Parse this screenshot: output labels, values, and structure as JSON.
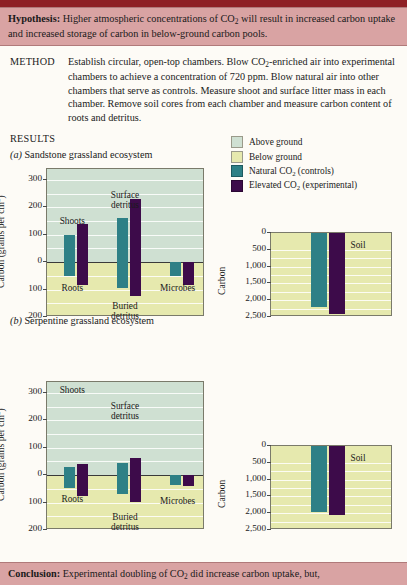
{
  "header": {
    "hypothesis_label": "Hypothesis:",
    "hypothesis_text_1": "Higher atmospheric concentrations of CO",
    "hypothesis_sub": "2",
    "hypothesis_text_2": " will result in increased carbon uptake and increased storage of carbon in below-ground carbon pools."
  },
  "method": {
    "label": "METHOD",
    "text_1": "Establish circular, open-top chambers. Blow CO",
    "sub_1": "2",
    "text_2": "-enriched air into experimental chambers to achieve a concentration of 720 ppm. Blow natural air into other chambers that serve as controls. Measure shoot and surface litter mass in each chamber. Remove soil cores from each chamber and measure carbon content of roots and detritus."
  },
  "results": {
    "label": "RESULTS"
  },
  "legend": {
    "items": [
      {
        "label": "Above ground",
        "color": "#cfe0d2"
      },
      {
        "label": "Below ground",
        "color": "#e6e9ae"
      },
      {
        "label": "Natural CO",
        "sub": "2",
        "suffix": " (controls)",
        "color": "#2e8086"
      },
      {
        "label": "Elevated CO",
        "sub": "2",
        "suffix": " (experimental)",
        "color": "#3d0b4a"
      }
    ]
  },
  "panels": [
    {
      "marker": "(a)",
      "title": "Sandstone grassland ecosystem",
      "main_chart": {
        "ylabel_1": "Carbon (grams per cm",
        "ylabel_sup": "2",
        "ylabel_2": ")",
        "ticks": [
          "300",
          "200",
          "100",
          "0",
          "100",
          "200"
        ],
        "group_labels_above": [
          "Shoots",
          "Surface detritus",
          ""
        ],
        "group_labels_below": [
          "Roots",
          "Buried detritus",
          "Microbes"
        ]
      },
      "soil_chart": {
        "ylabel": "Carbon",
        "ticks": [
          "0",
          "500",
          "1,000",
          "1,500",
          "2,000",
          "2,500"
        ],
        "area_label": "Soil"
      }
    },
    {
      "marker": "(b)",
      "title": "Serpentine grassland ecosystem",
      "main_chart": {
        "ylabel_1": "Carbon (grams per cm",
        "ylabel_sup": "2",
        "ylabel_2": ")",
        "ticks": [
          "300",
          "200",
          "100",
          "0",
          "100",
          "200"
        ],
        "group_labels_above": [
          "Shoots",
          "Surface detritus",
          ""
        ],
        "group_labels_below": [
          "Roots",
          "Buried detritus",
          "Microbes"
        ]
      },
      "soil_chart": {
        "ylabel": "Carbon",
        "ticks": [
          "0",
          "500",
          "1,000",
          "1,500",
          "2,000",
          "2,500"
        ],
        "area_label": "Soil"
      }
    }
  ],
  "conclusion": {
    "label": "Conclusion:",
    "text_1": " Experimental doubling of CO",
    "sub": "2",
    "text_2": " did increase carbon uptake, but,"
  },
  "chart_data": [
    {
      "type": "bar",
      "title": "(a) Sandstone grassland ecosystem",
      "ylabel": "Carbon (grams per cm2)",
      "ylim": [
        -200,
        340
      ],
      "yticks": [
        300,
        200,
        100,
        0,
        -100,
        -200
      ],
      "ytick_labels": [
        "300",
        "200",
        "100",
        "0",
        "100",
        "200"
      ],
      "grid": true,
      "categories": [
        "Shoots / Roots",
        "Surface detritus / Buried detritus",
        "Microbes"
      ],
      "series": [
        {
          "name": "Natural CO2 (controls)",
          "color": "#2e8086",
          "above": [
            100,
            160,
            0
          ],
          "below": [
            -50,
            -95,
            -50
          ]
        },
        {
          "name": "Elevated CO2 (experimental)",
          "color": "#3d0b4a",
          "above": [
            140,
            230,
            0
          ],
          "below": [
            -85,
            -125,
            -85
          ]
        }
      ]
    },
    {
      "type": "bar",
      "title": "(a) Soil",
      "ylabel": "Carbon",
      "ylim": [
        2500,
        0
      ],
      "yticks": [
        0,
        500,
        1000,
        1500,
        2000,
        2500
      ],
      "ytick_labels": [
        "0",
        "500",
        "1,000",
        "1,500",
        "2,000",
        "2,500"
      ],
      "inverted": true,
      "grid": true,
      "categories": [
        "Soil"
      ],
      "series": [
        {
          "name": "Natural CO2 (controls)",
          "color": "#2e8086",
          "values": [
            2200
          ]
        },
        {
          "name": "Elevated CO2 (experimental)",
          "color": "#3d0b4a",
          "values": [
            2400
          ]
        }
      ]
    },
    {
      "type": "bar",
      "title": "(b) Serpentine grassland ecosystem",
      "ylabel": "Carbon (grams per cm2)",
      "ylim": [
        -200,
        340
      ],
      "yticks": [
        300,
        200,
        100,
        0,
        -100,
        -200
      ],
      "ytick_labels": [
        "300",
        "200",
        "100",
        "0",
        "100",
        "200"
      ],
      "grid": true,
      "categories": [
        "Shoots / Roots",
        "Surface detritus / Buried detritus",
        "Microbes"
      ],
      "series": [
        {
          "name": "Natural CO2 (controls)",
          "color": "#2e8086",
          "above": [
            30,
            45,
            0
          ],
          "below": [
            -48,
            -68,
            -35
          ]
        },
        {
          "name": "Elevated CO2 (experimental)",
          "color": "#3d0b4a",
          "above": [
            40,
            62,
            0
          ],
          "below": [
            -75,
            -98,
            -38
          ]
        }
      ]
    },
    {
      "type": "bar",
      "title": "(b) Soil",
      "ylabel": "Carbon",
      "ylim": [
        2500,
        0
      ],
      "yticks": [
        0,
        500,
        1000,
        1500,
        2000,
        2500
      ],
      "ytick_labels": [
        "0",
        "500",
        "1,000",
        "1,500",
        "2,000",
        "2,500"
      ],
      "inverted": true,
      "grid": true,
      "categories": [
        "Soil"
      ],
      "series": [
        {
          "name": "Natural CO2 (controls)",
          "color": "#2e8086",
          "values": [
            1950
          ]
        },
        {
          "name": "Elevated CO2 (experimental)",
          "color": "#3d0b4a",
          "values": [
            2050
          ]
        }
      ]
    }
  ]
}
